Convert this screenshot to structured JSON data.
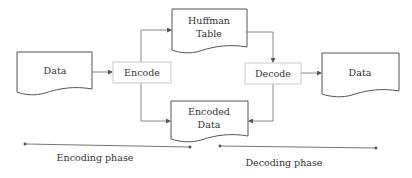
{
  "diagram": {
    "title": "",
    "nodes": {
      "input_data": {
        "label": "Data",
        "shape": "document"
      },
      "encode": {
        "label": "Encode",
        "shape": "process"
      },
      "huffman_table": {
        "label_line1": "Huffman",
        "label_line2": "Table",
        "shape": "document"
      },
      "encoded_data": {
        "label_line1": "Encoded",
        "label_line2": "Data",
        "shape": "document"
      },
      "decode": {
        "label": "Decode",
        "shape": "process"
      },
      "output_data": {
        "label": "Data",
        "shape": "document"
      }
    },
    "edges": [
      {
        "from": "input_data",
        "to": "encode"
      },
      {
        "from": "encode",
        "to": "huffman_table"
      },
      {
        "from": "encode",
        "to": "encoded_data"
      },
      {
        "from": "huffman_table",
        "to": "decode"
      },
      {
        "from": "decode",
        "to": "encoded_data"
      },
      {
        "from": "decode",
        "to": "output_data"
      }
    ],
    "phases": {
      "encoding": {
        "label": "Encoding phase"
      },
      "decoding": {
        "label": "Decoding phase"
      }
    },
    "colors": {
      "shape_border": "#555555",
      "process_border": "#c9c9c9",
      "connector": "#8a8a8a",
      "text": "#333333"
    }
  }
}
